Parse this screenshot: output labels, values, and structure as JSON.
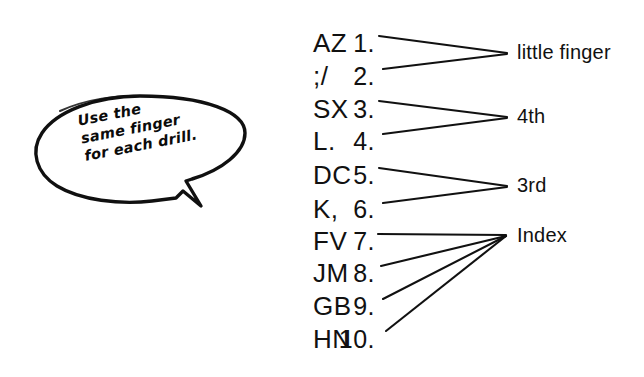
{
  "figure": {
    "type": "typing-drill-finger-assignment-diagram",
    "background_color": "#ffffff",
    "ink_color": "#111111"
  },
  "callout": {
    "name": "speech-bubble",
    "lines": [
      "Use the",
      "same finger",
      "for each drill."
    ],
    "line1": "Use the",
    "line2": "same finger",
    "line3": "for each drill."
  },
  "drills": [
    {
      "number": "1.",
      "keys": "AZ",
      "finger": "little finger"
    },
    {
      "number": "2.",
      "keys": ";/",
      "finger": "little finger"
    },
    {
      "number": "3.",
      "keys": "SX",
      "finger": "4th"
    },
    {
      "number": "4.",
      "keys": "L.",
      "finger": "4th"
    },
    {
      "number": "5.",
      "keys": "DC",
      "finger": "3rd"
    },
    {
      "number": "6.",
      "keys": "K,",
      "finger": "3rd"
    },
    {
      "number": "7.",
      "keys": "FV",
      "finger": "Index"
    },
    {
      "number": "8.",
      "keys": "JM",
      "finger": "Index"
    },
    {
      "number": "9.",
      "keys": "GB",
      "finger": "Index"
    },
    {
      "number": "10.",
      "keys": "HN",
      "finger": "Index"
    }
  ],
  "finger_labels": [
    {
      "text": "little finger",
      "drills": [
        "1.",
        "2."
      ]
    },
    {
      "text": "4th",
      "drills": [
        "3.",
        "4."
      ]
    },
    {
      "text": "3rd",
      "drills": [
        "5.",
        "6."
      ]
    },
    {
      "text": "Index",
      "drills": [
        "7.",
        "8.",
        "9.",
        "10."
      ]
    }
  ]
}
